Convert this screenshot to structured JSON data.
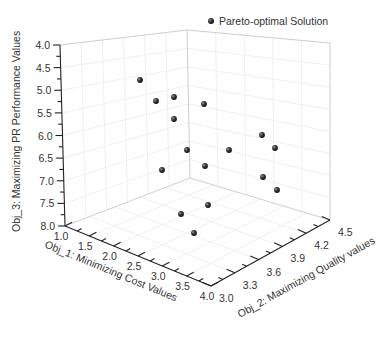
{
  "chart_data": {
    "type": "scatter3d",
    "title": "",
    "legend": {
      "entries": [
        "Pareto-optimal Solution"
      ],
      "position": "top-right"
    },
    "xlabel": "Obj_1: Minimizing Cost Values",
    "ylabel": "Obj_2: Maximizing Quality values",
    "zlabel": "Obj_3: Maximizing PR Performance Values",
    "x_ticks": [
      "1.0",
      "1.5",
      "2.0",
      "2.5",
      "3.0",
      "3.5",
      "4.0"
    ],
    "y_ticks": [
      "3.0",
      "3.3",
      "3.6",
      "3.9",
      "4.2",
      "4.5"
    ],
    "z_ticks": [
      "4.0",
      "4.5",
      "5.0",
      "5.5",
      "6.0",
      "6.5",
      "7.0",
      "7.5",
      "8.0"
    ],
    "xlim": [
      1.0,
      4.0
    ],
    "ylim": [
      3.0,
      4.5
    ],
    "zlim": [
      8.0,
      4.0
    ],
    "grid": true,
    "points_screen": [
      [
        140,
        80
      ],
      [
        156,
        101
      ],
      [
        174,
        97
      ],
      [
        204,
        104
      ],
      [
        174,
        119
      ],
      [
        187,
        150
      ],
      [
        229,
        150
      ],
      [
        162,
        170
      ],
      [
        205,
        166
      ],
      [
        262,
        135
      ],
      [
        275,
        148
      ],
      [
        263,
        177
      ],
      [
        277,
        190
      ],
      [
        181,
        214
      ],
      [
        208,
        205
      ],
      [
        194,
        233
      ]
    ],
    "points": [
      {
        "x": 1.8,
        "y": 3.3,
        "z": 4.7
      },
      {
        "x": 2.0,
        "y": 3.4,
        "z": 5.2
      },
      {
        "x": 1.8,
        "y": 3.6,
        "z": 5.1
      },
      {
        "x": 1.5,
        "y": 3.9,
        "z": 5.0
      },
      {
        "x": 2.2,
        "y": 3.6,
        "z": 5.6
      },
      {
        "x": 2.3,
        "y": 3.9,
        "z": 6.2
      },
      {
        "x": 2.0,
        "y": 4.3,
        "z": 6.0
      },
      {
        "x": 3.0,
        "y": 3.5,
        "z": 6.4
      },
      {
        "x": 2.6,
        "y": 3.9,
        "z": 6.4
      },
      {
        "x": 2.2,
        "y": 4.5,
        "z": 5.9
      },
      {
        "x": 2.5,
        "y": 4.5,
        "z": 6.2
      },
      {
        "x": 2.8,
        "y": 4.4,
        "z": 6.9
      },
      {
        "x": 3.1,
        "y": 4.5,
        "z": 7.1
      },
      {
        "x": 3.5,
        "y": 3.5,
        "z": 7.0
      },
      {
        "x": 3.2,
        "y": 3.8,
        "z": 7.0
      },
      {
        "x": 3.8,
        "y": 3.5,
        "z": 7.5
      }
    ]
  },
  "legend_label": "Pareto-optimal Solution",
  "axes": {
    "z_title": "Obj_3: Maximizing PR Performance Values",
    "x_title": "Obj_1: Minimizing Cost Values",
    "y_title": "Obj_2: Maximizing Quality values",
    "z_ticks": [
      "4.0",
      "4.5",
      "5.0",
      "5.5",
      "6.0",
      "6.5",
      "7.0",
      "7.5",
      "8.0"
    ],
    "x_ticks": [
      "1.0",
      "1.5",
      "2.0",
      "2.5",
      "3.0",
      "3.5",
      "4.0"
    ],
    "y_ticks": [
      "3.0",
      "3.3",
      "3.6",
      "3.9",
      "4.2",
      "4.5"
    ]
  },
  "colors": {
    "point": "#2a2a2a",
    "axis": "#222222",
    "grid": "#ececec",
    "text": "#333333"
  }
}
